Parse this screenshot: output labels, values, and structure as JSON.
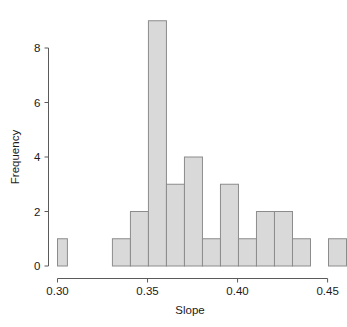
{
  "chart_data": {
    "type": "bar",
    "subtype": "histogram",
    "title": "",
    "xlabel": "Slope",
    "ylabel": "Frequency",
    "xlim": [
      0.3,
      0.46
    ],
    "ylim": [
      0,
      9
    ],
    "grid": false,
    "legend": null,
    "bin_width": 0.005,
    "bar_fill_color": "#d9d9d9",
    "bar_border_color": "#8c8c8c",
    "axis_color": "#5a5a5a",
    "xticks": [
      0.3,
      0.35,
      0.4,
      0.45
    ],
    "xtick_labels": [
      "0.30",
      "0.35",
      "0.40",
      "0.45"
    ],
    "yticks": [
      0,
      2,
      4,
      6,
      8
    ],
    "ytick_labels": [
      "0",
      "2",
      "4",
      "6",
      "8"
    ],
    "bins": [
      {
        "left": 0.3,
        "right": 0.305,
        "count": 1
      },
      {
        "left": 0.305,
        "right": 0.31,
        "count": 0
      },
      {
        "left": 0.31,
        "right": 0.315,
        "count": 0
      },
      {
        "left": 0.315,
        "right": 0.32,
        "count": 0
      },
      {
        "left": 0.32,
        "right": 0.325,
        "count": 0
      },
      {
        "left": 0.325,
        "right": 0.33,
        "count": 0
      },
      {
        "left": 0.33,
        "right": 0.335,
        "count": 1
      },
      {
        "left": 0.335,
        "right": 0.34,
        "count": 1
      },
      {
        "left": 0.34,
        "right": 0.345,
        "count": 2
      },
      {
        "left": 0.345,
        "right": 0.35,
        "count": 2
      },
      {
        "left": 0.35,
        "right": 0.355,
        "count": 9
      },
      {
        "left": 0.355,
        "right": 0.36,
        "count": 9
      },
      {
        "left": 0.36,
        "right": 0.365,
        "count": 3
      },
      {
        "left": 0.365,
        "right": 0.37,
        "count": 3
      },
      {
        "left": 0.37,
        "right": 0.375,
        "count": 4
      },
      {
        "left": 0.375,
        "right": 0.38,
        "count": 4
      },
      {
        "left": 0.38,
        "right": 0.385,
        "count": 1
      },
      {
        "left": 0.385,
        "right": 0.39,
        "count": 1
      },
      {
        "left": 0.39,
        "right": 0.395,
        "count": 3
      },
      {
        "left": 0.395,
        "right": 0.4,
        "count": 3
      },
      {
        "left": 0.4,
        "right": 0.405,
        "count": 1
      },
      {
        "left": 0.405,
        "right": 0.41,
        "count": 1
      },
      {
        "left": 0.41,
        "right": 0.415,
        "count": 2
      },
      {
        "left": 0.415,
        "right": 0.42,
        "count": 2
      },
      {
        "left": 0.42,
        "right": 0.425,
        "count": 2
      },
      {
        "left": 0.425,
        "right": 0.43,
        "count": 1
      },
      {
        "left": 0.43,
        "right": 0.435,
        "count": 1
      },
      {
        "left": 0.435,
        "right": 0.44,
        "count": 0
      },
      {
        "left": 0.44,
        "right": 0.445,
        "count": 0
      },
      {
        "left": 0.445,
        "right": 0.45,
        "count": 1
      },
      {
        "left": 0.45,
        "right": 0.455,
        "count": 1
      }
    ],
    "bars_merged": [
      {
        "left": 0.3,
        "right": 0.3055,
        "count": 1
      },
      {
        "left": 0.3305,
        "right": 0.3405,
        "count": 1
      },
      {
        "left": 0.3405,
        "right": 0.3505,
        "count": 2
      },
      {
        "left": 0.3505,
        "right": 0.3605,
        "count": 9
      },
      {
        "left": 0.3605,
        "right": 0.3705,
        "count": 3
      },
      {
        "left": 0.3705,
        "right": 0.3805,
        "count": 4
      },
      {
        "left": 0.3805,
        "right": 0.3905,
        "count": 1
      },
      {
        "left": 0.3905,
        "right": 0.4005,
        "count": 3
      },
      {
        "left": 0.4005,
        "right": 0.4105,
        "count": 1
      },
      {
        "left": 0.4105,
        "right": 0.4205,
        "count": 2
      },
      {
        "left": 0.4205,
        "right": 0.4305,
        "count": 2
      },
      {
        "left": 0.4305,
        "right": 0.4405,
        "count": 1
      },
      {
        "left": 0.4505,
        "right": 0.4605,
        "count": 1
      }
    ]
  },
  "axes": {
    "x_title": "Slope",
    "y_title": "Frequency"
  }
}
